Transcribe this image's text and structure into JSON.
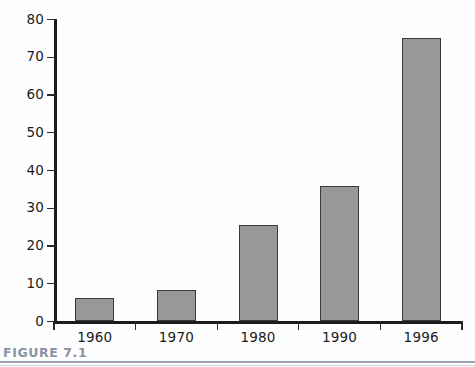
{
  "figure": {
    "caption_label": "FIGURE 7.1",
    "caption_color": "#8a94a3",
    "rule_color": "#9aa3b0"
  },
  "colors": {
    "bar_fill": "#989898",
    "bar_stroke": "#3a3a3a",
    "axis": "#1c1c1c",
    "background": "#ffffff",
    "text": "#1b1b1b"
  },
  "chart_data": {
    "type": "bar",
    "title": "",
    "subtitle": "",
    "xlabel": "",
    "ylabel": "",
    "categories": [
      "1960",
      "1970",
      "1980",
      "1990",
      "1996"
    ],
    "values": [
      6.3,
      8.3,
      25.5,
      36,
      75.2
    ],
    "series": [
      {
        "name": "",
        "values": [
          6.3,
          8.3,
          25.5,
          36,
          75.2
        ]
      }
    ],
    "ylim": [
      0,
      80
    ],
    "yticks": [
      0,
      10,
      20,
      30,
      40,
      50,
      60,
      70,
      80
    ],
    "ytick_labels": [
      "0",
      "10",
      "20",
      "30",
      "40",
      "50",
      "60",
      "70",
      "80"
    ],
    "xtick_labels": [
      "1960",
      "1970",
      "1980",
      "1990",
      "1996"
    ],
    "grid": false,
    "legend": null,
    "legend_position": "none",
    "annotations": []
  }
}
